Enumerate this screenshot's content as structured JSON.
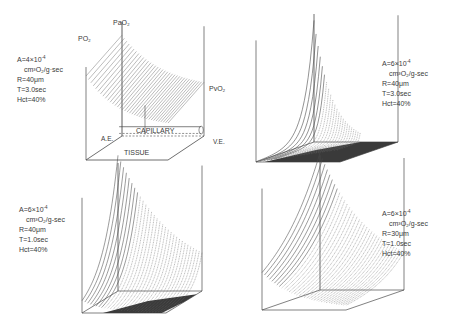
{
  "figure": {
    "panels": [
      {
        "id": "top-left",
        "params": {
          "A": "A=4×10",
          "A_exp": "-4",
          "A_unit": "cm³O₂/g·sec",
          "R": "R=40μm",
          "T": "T=3.0sec",
          "Hct": "Hct=40%"
        },
        "labels": {
          "po2": "PO₂",
          "pao2": "PaO₂",
          "pvo2": "PvO₂",
          "capillary": "CAPILLARY",
          "tissue": "TISSUE",
          "ae": "A.E.",
          "ve": "V.E."
        }
      },
      {
        "id": "top-right",
        "params": {
          "A": "A=6×10",
          "A_exp": "-4",
          "A_unit": "cm³O₂/g-sec",
          "R": "R=40μm",
          "T": "T=3.0sec",
          "Hct": "Hct=40%"
        }
      },
      {
        "id": "bottom-left",
        "params": {
          "A": "A=6×10",
          "A_exp": "-4",
          "A_unit": "cm³O₂/g-sec",
          "R": "R=40μm",
          "T": "T=1.0sec",
          "Hct": "Hct=40%"
        }
      },
      {
        "id": "bottom-right",
        "params": {
          "A": "A=6×10",
          "A_exp": "-4",
          "A_unit": "cm³O₂/g-sec",
          "R": "R=30μm",
          "T": "T=1.0sec",
          "Hct": "Hct=40%"
        }
      }
    ]
  },
  "colors": {
    "line": "#4a4a4a",
    "surface": "#6a6a6a",
    "shadow": "#3a3a3a",
    "background": "#ffffff"
  }
}
